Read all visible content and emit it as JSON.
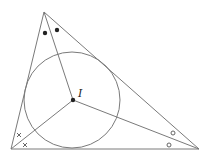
{
  "diagram": {
    "stroke_color": "#7a7a7a",
    "mark_color": "#222222",
    "vertices": {
      "top": {
        "x": 44,
        "y": 12
      },
      "bottom_left": {
        "x": 11,
        "y": 149
      },
      "bottom_right": {
        "x": 199,
        "y": 149
      }
    },
    "incenter": {
      "x": 73,
      "y": 100,
      "label": "I"
    },
    "incircle": {
      "cx": 72,
      "cy": 100,
      "r": 48
    },
    "angle_marks": {
      "top": {
        "symbol": "filled-dot",
        "points": [
          {
            "x": 45,
            "y": 33
          },
          {
            "x": 57,
            "y": 30
          }
        ]
      },
      "bottom_left": {
        "symbol": "cross",
        "points": [
          {
            "x": 19,
            "y": 135
          },
          {
            "x": 25,
            "y": 145
          }
        ]
      },
      "bottom_right": {
        "symbol": "open-circle",
        "points": [
          {
            "x": 173,
            "y": 133
          },
          {
            "x": 169,
            "y": 145
          }
        ]
      }
    }
  }
}
